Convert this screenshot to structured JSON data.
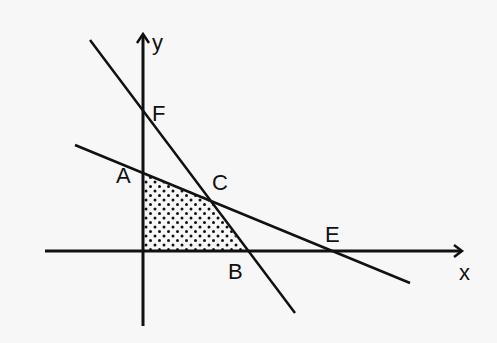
{
  "diagram": {
    "type": "linear-programming-feasible-region",
    "axes": {
      "x_label": "x",
      "y_label": "y",
      "origin": [
        143,
        251
      ],
      "x_axis": {
        "from": [
          45,
          251
        ],
        "to": [
          463,
          251
        ]
      },
      "y_axis": {
        "from": [
          143,
          326
        ],
        "to": [
          143,
          34
        ]
      }
    },
    "lines": [
      {
        "name": "steep-line",
        "from": [
          90,
          40
        ],
        "to": [
          295,
          313
        ],
        "passes_through": [
          "F",
          "C",
          "B"
        ]
      },
      {
        "name": "shallow-line",
        "from": [
          75,
          145
        ],
        "to": [
          410,
          283
        ],
        "passes_through": [
          "A",
          "C",
          "E"
        ]
      }
    ],
    "points": [
      {
        "label": "F",
        "at": [
          143,
          112
        ],
        "label_pos": [
          152,
          121
        ]
      },
      {
        "label": "A",
        "at": [
          143,
          173
        ],
        "label_pos": [
          116,
          183
        ]
      },
      {
        "label": "C",
        "at": [
          210,
          199
        ],
        "label_pos": [
          212,
          188
        ]
      },
      {
        "label": "B",
        "at": [
          246,
          251
        ],
        "label_pos": [
          228,
          279
        ]
      },
      {
        "label": "E",
        "at": [
          333,
          251
        ],
        "label_pos": [
          325,
          240
        ]
      }
    ],
    "shaded_region": {
      "vertices": [
        "O",
        "A",
        "C",
        "B"
      ],
      "pattern": "dotted",
      "polygon": [
        [
          143,
          251
        ],
        [
          143,
          173
        ],
        [
          210,
          199
        ],
        [
          246,
          251
        ]
      ]
    },
    "colors": {
      "ink": "#111111",
      "background": "#f7f7f7"
    }
  }
}
